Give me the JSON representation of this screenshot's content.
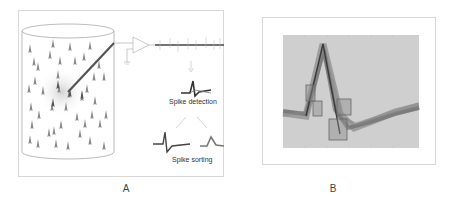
{
  "figure": {
    "panels": [
      {
        "id": "A",
        "label": "A",
        "description": "Extracellular recording schematic",
        "components": {
          "tissue": "cylinder of neurons",
          "electrode": "recording electrode",
          "amplifier": "amplifier with ground",
          "raw_signal": "filtered continuous trace with spikes"
        },
        "captions": {
          "detection": "Spike detection",
          "sorting": "Spike sorting"
        }
      },
      {
        "id": "B",
        "label": "B",
        "description": "Overlaid spike waveforms with template-matching windows",
        "colors": {
          "background": "#cfcfcf",
          "waveforms": "#6e6e6e",
          "windows": "#8a8a8a"
        }
      }
    ]
  }
}
